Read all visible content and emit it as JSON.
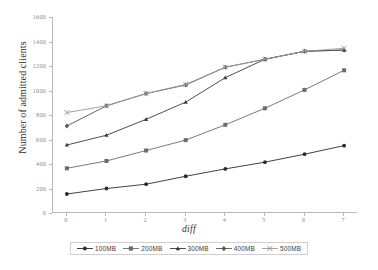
{
  "chart_data": {
    "type": "line",
    "title": "",
    "xlabel": "diff",
    "ylabel": "Number of admitted clients",
    "x": [
      0,
      1,
      2,
      3,
      4,
      5,
      6,
      7
    ],
    "xticklabels": [
      "0",
      "1",
      "2",
      "3",
      "4",
      "5",
      "6",
      "7"
    ],
    "yticklabels": [
      "0",
      "200",
      "400",
      "600",
      "800",
      "1000",
      "1200",
      "1400",
      "1600"
    ],
    "yticks": [
      0,
      200,
      400,
      600,
      800,
      1000,
      1200,
      1400,
      1600
    ],
    "xlim": [
      -0.35,
      7.35
    ],
    "ylim": [
      0,
      1600
    ],
    "grid": false,
    "legend_position": "below-center",
    "series": [
      {
        "name": "100MB",
        "marker": "circle",
        "color": "#2b2b2b",
        "values": [
          155,
          200,
          235,
          300,
          360,
          415,
          480,
          550
        ]
      },
      {
        "name": "200MB",
        "marker": "square",
        "color": "#6b6b6b",
        "values": [
          365,
          425,
          510,
          595,
          720,
          855,
          1005,
          1165
        ]
      },
      {
        "name": "300MB",
        "marker": "triangle",
        "color": "#3a3a3a",
        "values": [
          555,
          635,
          765,
          905,
          1105,
          1255,
          1320,
          1330
        ]
      },
      {
        "name": "400MB",
        "marker": "diamond",
        "color": "#555555",
        "values": [
          710,
          875,
          975,
          1045,
          1190,
          1255,
          1320,
          1330
        ]
      },
      {
        "name": "500MB",
        "marker": "cross",
        "color": "#9a9a9a",
        "values": [
          820,
          875,
          975,
          1050,
          1190,
          1255,
          1320,
          1345
        ]
      }
    ]
  },
  "axis": {
    "line_color": "#b9b9b9",
    "tick_text_color": "#8a8a8a"
  },
  "legend": {
    "items": [
      "100MB",
      "200MB",
      "300MB",
      "400MB",
      "500MB"
    ]
  }
}
